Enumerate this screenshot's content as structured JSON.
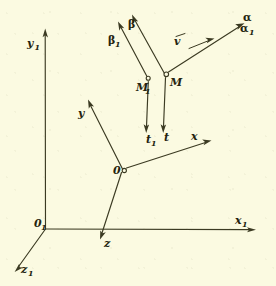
{
  "figure": {
    "kind": "hand-drawn-vector-diagram",
    "background_color": "#fbfae1",
    "ink_color": "#3b3a22",
    "width": 276,
    "height": 286
  },
  "axes": {
    "fixed_frame": {
      "origin_label": "0",
      "origin_sub": "1",
      "items": [
        {
          "name": "y1-axis",
          "label": "y",
          "sub": "1",
          "direction": "up"
        },
        {
          "name": "x1-axis",
          "label": "x",
          "sub": "1",
          "direction": "right"
        },
        {
          "name": "z1-axis",
          "label": "z",
          "sub": "1",
          "direction": "down-left"
        }
      ]
    },
    "moving_frame": {
      "origin_label": "0",
      "origin_sub": "",
      "items": [
        {
          "name": "y-axis",
          "label": "y",
          "sub": "",
          "direction": "up-left"
        },
        {
          "name": "x-axis",
          "label": "x",
          "sub": "",
          "direction": "up-right"
        },
        {
          "name": "z-axis",
          "label": "z",
          "sub": "",
          "direction": "down-left"
        }
      ]
    }
  },
  "points": [
    {
      "name": "point-M1",
      "label": "M",
      "sub": "1"
    },
    {
      "name": "point-M",
      "label": "M",
      "sub": ""
    }
  ],
  "vectors": [
    {
      "name": "vector-beta1",
      "label": "β",
      "sub": "1"
    },
    {
      "name": "vector-beta",
      "label": "β",
      "sub": ""
    },
    {
      "name": "vector-alpha",
      "label": "α",
      "sub": ""
    },
    {
      "name": "vector-alpha1",
      "label": "α",
      "sub": "1"
    },
    {
      "name": "vector-t1",
      "label": "t",
      "sub": "1"
    },
    {
      "name": "vector-t",
      "label": "t",
      "sub": ""
    },
    {
      "name": "vector-v",
      "label": "v",
      "sub": "",
      "overbar": true
    }
  ]
}
